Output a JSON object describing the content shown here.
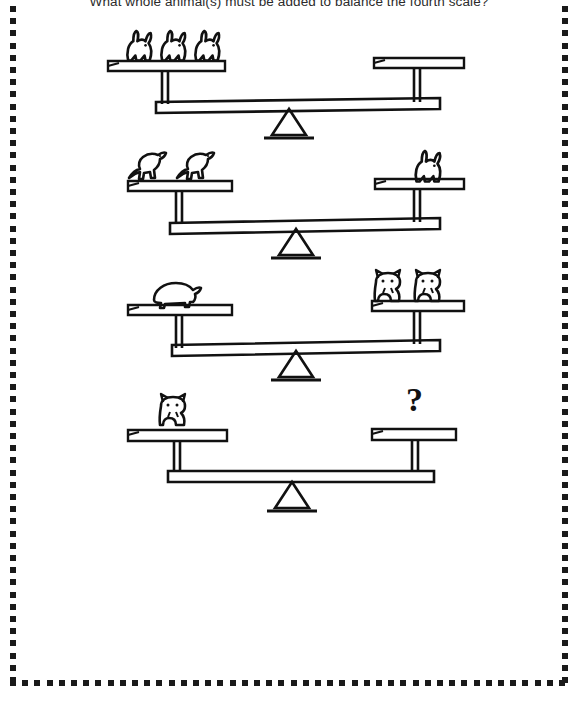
{
  "page": {
    "title": "What whole animal(s) must be added to balance the fourth scale?",
    "background_color": "#ffffff",
    "ink_color": "#111111",
    "border": {
      "style": "dotted-squares",
      "dot_color": "#1a1a1a",
      "dot_size_px": 6,
      "dot_spacing_px": 12.2
    }
  },
  "puzzle": {
    "type": "balance-scale-equivalence",
    "question": "What whole animal(s) must be added to balance the fourth scale?",
    "scales": [
      {
        "index": 1,
        "label": "scale-1",
        "state": "balanced",
        "tilt": "left-low",
        "left": {
          "animal": "rabbit",
          "count": 3,
          "icon": "rabbit-icon"
        },
        "right": {
          "animal": "guinea-pig",
          "count": 1,
          "icon": "guinea-pig-icon"
        }
      },
      {
        "index": 2,
        "label": "scale-2",
        "state": "balanced",
        "tilt": "left-low",
        "left": {
          "animal": "cat",
          "count": 2,
          "icon": "cat-jumping-icon"
        },
        "right": {
          "animal": "rabbit",
          "count": 1,
          "icon": "rabbit-icon"
        }
      },
      {
        "index": 3,
        "label": "scale-3",
        "state": "balanced",
        "tilt": "left-low",
        "left": {
          "animal": "guinea-pig",
          "count": 1,
          "icon": "guinea-pig-icon"
        },
        "right": {
          "animal": "hamster",
          "count": 2,
          "icon": "hamster-icon"
        }
      },
      {
        "index": 4,
        "label": "scale-4",
        "state": "unknown",
        "tilt": "level",
        "left": {
          "animal": "hamster",
          "count": 1,
          "icon": "hamster-icon"
        },
        "right": {
          "animal": "unknown",
          "count": null,
          "icon": "question-mark-icon",
          "marker": "?"
        }
      }
    ]
  }
}
